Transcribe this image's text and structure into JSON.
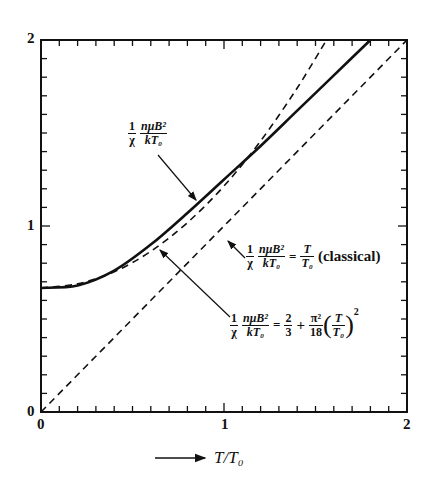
{
  "chart_data": {
    "type": "line",
    "title": "",
    "xlabel": "T/T0",
    "ylabel": "",
    "xlim": [
      0,
      2
    ],
    "ylim": [
      0,
      2
    ],
    "grid": false,
    "x_ticks": [
      "0",
      "1",
      "2"
    ],
    "y_ticks": [
      "0",
      "1",
      "2"
    ],
    "series": [
      {
        "name": "(1/χ) nμB²/kT0",
        "style": "solid",
        "x": [
          0,
          0.2,
          0.4,
          0.6,
          0.8,
          1.0,
          1.2,
          1.4,
          1.6,
          1.8
        ],
        "y": [
          0.667,
          0.68,
          0.76,
          0.9,
          1.07,
          1.25,
          1.43,
          1.62,
          1.81,
          2.0
        ]
      },
      {
        "name": "(1/χ) nμB²/kT0 = T/T0 (classical)",
        "style": "dashed",
        "x": [
          0,
          2
        ],
        "y": [
          0,
          2
        ]
      },
      {
        "name": "(1/χ) nμB²/kT0 = 2/3 + π²/18 (T/T0)²",
        "style": "dashed",
        "x": [
          0,
          0.2,
          0.4,
          0.6,
          0.8,
          1.0,
          1.2,
          1.4,
          1.56
        ],
        "y": [
          0.667,
          0.689,
          0.754,
          0.864,
          1.018,
          1.215,
          1.457,
          1.742,
          2.0
        ]
      }
    ],
    "annotations": [
      {
        "text": "(1/χ) nμB²/kT0",
        "points_to": "solid curve"
      },
      {
        "text": "(1/χ) nμB²/kT0 = T/T0 (classical)",
        "points_to": "straight dashed line"
      },
      {
        "text": "(1/χ) nμB²/kT0 = 2/3 + π²/18 (T/T0)²",
        "points_to": "quadratic dashed curve"
      }
    ]
  },
  "axes": {
    "x_tick_0": "0",
    "x_tick_1": "1",
    "x_tick_2": "2",
    "y_tick_0": "0",
    "y_tick_1": "1",
    "y_tick_2": "2",
    "xlabel": "T/T₀"
  },
  "labels": {
    "one": "1",
    "chi": "χ",
    "num": "nμB²",
    "den": "kT₀",
    "equals": "=",
    "T": "T",
    "T0": "T₀",
    "classical": "(classical)",
    "two": "2",
    "three": "3",
    "plus": "+",
    "pi2": "π²",
    "eighteen": "18",
    "sq": "2"
  }
}
